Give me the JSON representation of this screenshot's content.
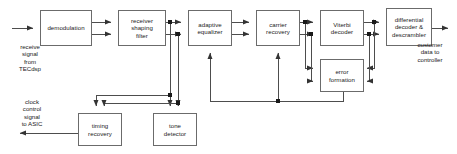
{
  "diagram": {
    "stroke_color": "#6b6b6b",
    "wire_color": "#4d4d4d",
    "text_color": "#1a1a1a",
    "background": "#ffffff",
    "blocks": [
      {
        "id": "demodulation",
        "label": "demodulation",
        "x": 40,
        "y": 10,
        "w": 52,
        "h": 36
      },
      {
        "id": "receiver-shaping-filter",
        "label": "receiver\nshaping\nfilter",
        "x": 118,
        "y": 10,
        "w": 48,
        "h": 36
      },
      {
        "id": "adaptive-equalizer",
        "label": "adaptive\nequalizer",
        "x": 188,
        "y": 10,
        "w": 44,
        "h": 36
      },
      {
        "id": "carrier-recovery",
        "label": "carrier\nrecovery",
        "x": 256,
        "y": 10,
        "w": 44,
        "h": 36
      },
      {
        "id": "viterbi-decoder",
        "label": "Viterbi\ndecoder",
        "x": 320,
        "y": 10,
        "w": 44,
        "h": 36
      },
      {
        "id": "differential-decoder-descrambler",
        "label": "differential\ndecoder &\ndescrambler",
        "x": 386,
        "y": 8,
        "w": 46,
        "h": 38
      },
      {
        "id": "error-formation",
        "label": "error\nformation",
        "x": 320,
        "y": 59,
        "w": 44,
        "h": 33
      },
      {
        "id": "timing-recovery",
        "label": "timing\nrecovery",
        "x": 78,
        "y": 113,
        "w": 44,
        "h": 33
      },
      {
        "id": "tone-detector",
        "label": "tone\ndetector",
        "x": 153,
        "y": 113,
        "w": 44,
        "h": 33
      }
    ],
    "annotations": [
      {
        "id": "receive-signal-source",
        "text": "receive\nsignal\nfrom\nTECdsp",
        "x": 6,
        "y": 43,
        "w": 48
      },
      {
        "id": "clock-control-output",
        "text": "clock\ncontrol\nsignal\nto ASIC",
        "x": 8,
        "y": 98,
        "w": 48
      },
      {
        "id": "customer-data-output",
        "text": "customer\ndata to\ncontroller",
        "x": 404,
        "y": 41,
        "w": 52
      }
    ]
  }
}
